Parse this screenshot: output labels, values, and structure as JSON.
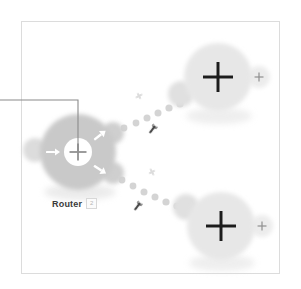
{
  "diagram": {
    "background_color": "#ffffff",
    "frame_color": "#dcdcdc",
    "callout": {
      "name": "router-center-callout",
      "label": "",
      "color": "#8a8a8a",
      "from_x": 0,
      "to_x": 78,
      "y": 100,
      "drop_to_y": 152
    },
    "nodes": [
      {
        "id": "router",
        "label": "Router",
        "badge": "2",
        "type": "router",
        "cx": 78,
        "cy": 152,
        "r": 38,
        "fill": "#c9c9c9",
        "icon": "plus-icon",
        "icon_color": "#9a9a9a",
        "arrows": [
          "arrow-right",
          "arrow-up-right",
          "arrow-down-right"
        ],
        "arrow_color": "#ffffff"
      },
      {
        "id": "node-top",
        "label": "",
        "badge": "",
        "type": "host",
        "cx": 218,
        "cy": 77,
        "r": 34,
        "fill": "#e7e7e7",
        "icon": "plus-icon",
        "icon_color": "#1c1c1c",
        "tab_icon": "plus-small-icon"
      },
      {
        "id": "node-bottom",
        "label": "",
        "badge": "",
        "type": "host",
        "cx": 221,
        "cy": 226,
        "r": 34,
        "fill": "#e7e7e7",
        "icon": "plus-icon",
        "icon_color": "#1c1c1c",
        "tab_icon": "plus-small-icon"
      }
    ],
    "links": [
      {
        "id": "link-router-top",
        "from": "router",
        "to": "node-top",
        "style": "dotted",
        "dot_color": "#d6d6d6",
        "markers": [
          {
            "icon": "link-marker-icon",
            "color": "#d9d9d9",
            "x": 139,
            "y": 96
          },
          {
            "icon": "wrench-icon",
            "color": "#4a4a4a",
            "x": 152,
            "y": 130
          }
        ]
      },
      {
        "id": "link-router-bottom",
        "from": "router",
        "to": "node-bottom",
        "style": "dotted",
        "dot_color": "#d6d6d6",
        "markers": [
          {
            "icon": "link-marker-icon",
            "color": "#d9d9d9",
            "x": 152,
            "y": 172
          },
          {
            "icon": "wrench-icon",
            "color": "#4a4a4a",
            "x": 137,
            "y": 207
          }
        ]
      }
    ]
  }
}
